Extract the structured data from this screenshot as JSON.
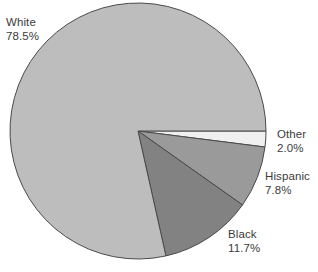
{
  "chart_data": {
    "type": "pie",
    "title": "",
    "subtitle": "",
    "xlabel": "",
    "ylabel": "",
    "legend_position": "none",
    "grid": false,
    "labels_inline": true,
    "start_angle_deg": 0,
    "direction": "clockwise",
    "categories": [
      "White",
      "Black",
      "Hispanic",
      "Other"
    ],
    "values": [
      78.5,
      11.7,
      7.8,
      2.0
    ],
    "value_suffix": "%",
    "slices": [
      {
        "name": "White",
        "value": 78.5,
        "value_text": "78.5%",
        "color": "#bdbdbd"
      },
      {
        "name": "Black",
        "value": 11.7,
        "value_text": "11.7%",
        "color": "#828282"
      },
      {
        "name": "Hispanic",
        "value": 7.8,
        "value_text": "7.8%",
        "color": "#9a9a9a"
      },
      {
        "name": "Other",
        "value": 2.0,
        "value_text": "2.0%",
        "color": "#f0f0f0"
      }
    ]
  },
  "labels": {
    "white": {
      "name": "White",
      "value": "78.5%"
    },
    "other": {
      "name": "Other",
      "value": "2.0%"
    },
    "hispanic": {
      "name": "Hispanic",
      "value": "7.8%"
    },
    "black": {
      "name": "Black",
      "value": "11.7%"
    }
  },
  "colors": {
    "background": "#ffffff",
    "text": "#3b3b3b",
    "outline": "#4a4a4a",
    "white_slice": "#bdbdbd",
    "black_slice": "#828282",
    "hispanic_slice": "#9a9a9a",
    "other_slice": "#f0f0f0"
  },
  "geometry": {
    "center_x": 138,
    "center_y": 131,
    "radius": 128
  }
}
